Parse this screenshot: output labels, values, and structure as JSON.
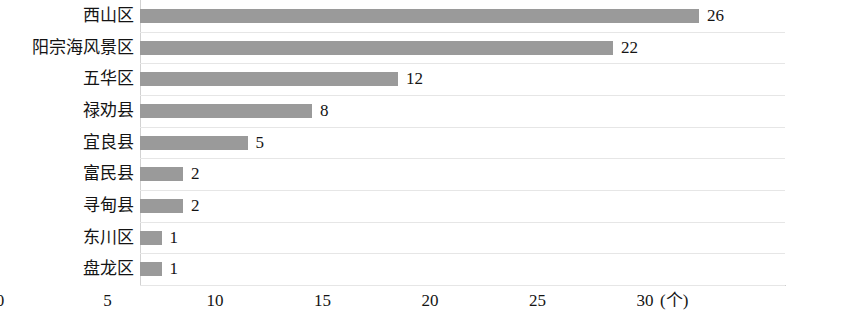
{
  "chart_data": {
    "type": "bar",
    "orientation": "horizontal",
    "title": "",
    "subtitle": "",
    "xlabel": "",
    "ylabel": "",
    "unit_label": "(个)",
    "categories": [
      "西山区",
      "阳宗海风景区",
      "五华区",
      "禄劝县",
      "宜良县",
      "富民县",
      "寻甸县",
      "东川区",
      "盘龙区"
    ],
    "values": [
      26,
      22,
      12,
      8,
      5,
      2,
      2,
      1,
      1
    ],
    "value_labels": [
      "26",
      "22",
      "12",
      "8",
      "5",
      "2",
      "2",
      "1",
      "1"
    ],
    "xlim": [
      0,
      30
    ],
    "xticks": [
      0,
      5,
      10,
      15,
      20,
      25,
      30
    ],
    "xtick_labels": [
      "0",
      "5",
      "10",
      "15",
      "20",
      "25",
      "30"
    ],
    "grid": true,
    "legend": false,
    "bar_color": "#9a9a9a",
    "gridline_color": "#e6e6e6",
    "axis_color": "#cfcfcf",
    "background_color": "#ffffff",
    "text_color": "#141414"
  }
}
